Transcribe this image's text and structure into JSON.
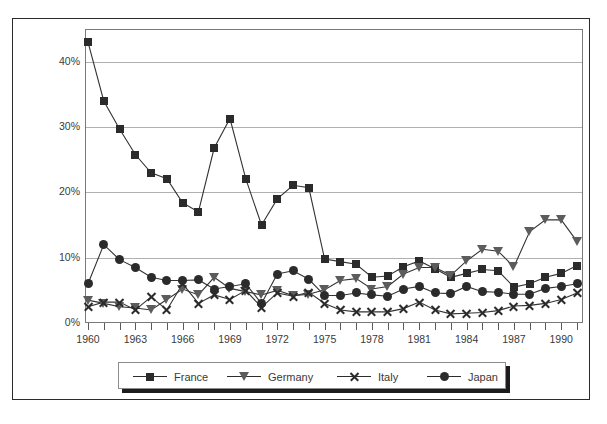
{
  "chart_data": {
    "type": "line",
    "title": "",
    "xlabel": "",
    "ylabel": "",
    "xlim": [
      1960,
      1991
    ],
    "ylim": [
      0,
      45
    ],
    "grid": true,
    "legend_position": "bottom",
    "ytick_labels": [
      "0%",
      "10%",
      "20%",
      "30%",
      "40%"
    ],
    "ytick_values": [
      0,
      10,
      20,
      30,
      40
    ],
    "xtick_labels": [
      "1960",
      "1963",
      "1966",
      "1969",
      "1972",
      "1975",
      "1978",
      "1981",
      "1984",
      "1987",
      "1990"
    ],
    "xtick_values": [
      1960,
      1963,
      1966,
      1969,
      1972,
      1975,
      1978,
      1981,
      1984,
      1987,
      1990
    ],
    "x": [
      1960,
      1961,
      1962,
      1963,
      1964,
      1965,
      1966,
      1967,
      1968,
      1969,
      1970,
      1971,
      1972,
      1973,
      1974,
      1975,
      1976,
      1977,
      1978,
      1979,
      1980,
      1981,
      1982,
      1983,
      1984,
      1985,
      1986,
      1987,
      1988,
      1989,
      1990,
      1991
    ],
    "series": [
      {
        "name": "France",
        "marker": "square",
        "color": "#2b2b2b",
        "values": [
          43.0,
          34.0,
          29.7,
          25.8,
          23.0,
          22.1,
          18.4,
          17.0,
          26.8,
          31.3,
          22.1,
          15.0,
          19.0,
          21.1,
          20.7,
          9.8,
          9.4,
          9.0,
          7.0,
          7.2,
          8.6,
          9.5,
          8.3,
          7.0,
          7.6,
          8.2,
          8.0,
          5.5,
          6.0,
          7.0,
          7.6,
          8.8
        ]
      },
      {
        "name": "Germany",
        "marker": "triangle-down",
        "color": "#5c5c5c",
        "values": [
          3.5,
          3.0,
          2.5,
          2.3,
          2.0,
          3.6,
          5.2,
          4.3,
          7.0,
          5.3,
          4.8,
          4.3,
          5.0,
          4.2,
          4.4,
          5.1,
          6.5,
          6.8,
          5.2,
          5.6,
          7.5,
          8.5,
          8.5,
          7.3,
          9.5,
          11.3,
          11.0,
          8.6,
          14.0,
          15.8,
          15.8,
          12.5
        ]
      },
      {
        "name": "Italy",
        "marker": "x",
        "color": "#2b2b2b",
        "values": [
          2.5,
          3.2,
          3.2,
          2.0,
          4.0,
          2.0,
          6.0,
          3.0,
          4.3,
          3.6,
          5.0,
          2.4,
          4.6,
          4.1,
          4.7,
          3.0,
          2.0,
          1.7,
          1.7,
          1.7,
          2.2,
          3.2,
          2.0,
          1.4,
          1.5,
          1.6,
          1.9,
          2.6,
          2.7,
          3.0,
          3.6,
          4.6
        ]
      },
      {
        "name": "Japan",
        "marker": "circle",
        "color": "#2b2b2b",
        "values": [
          6.0,
          12.0,
          9.7,
          8.5,
          7.0,
          6.5,
          6.5,
          6.6,
          5.2,
          5.6,
          6.0,
          3.0,
          7.5,
          8.0,
          6.7,
          4.2,
          4.2,
          4.6,
          4.3,
          4.1,
          5.2,
          5.6,
          4.6,
          4.5,
          5.6,
          4.8,
          4.7,
          4.4,
          4.4,
          5.3,
          5.6,
          6.0
        ]
      }
    ]
  },
  "legend": {
    "items": [
      {
        "label": "France",
        "marker": "square-icon"
      },
      {
        "label": "Germany",
        "marker": "triangle-down-icon"
      },
      {
        "label": "Italy",
        "marker": "x-icon"
      },
      {
        "label": "Japan",
        "marker": "circle-icon"
      }
    ]
  }
}
